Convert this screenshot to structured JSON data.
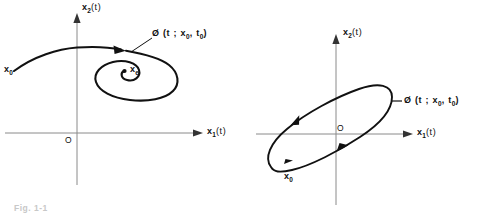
{
  "figure": {
    "caption": "Fig. 1-1",
    "ink_color": "#111111",
    "axis_color": "#8a8a8a"
  },
  "panels": [
    {
      "id": "left",
      "kind": "spiral-trajectory",
      "axis_x_label_main": "x",
      "axis_x_label_sub": "1",
      "axis_x_label_tail": "(t)",
      "axis_y_label_main": "x",
      "axis_y_label_sub": "2",
      "axis_y_label_tail": "(t)",
      "origin_label": "O",
      "initial_state_main": "x",
      "initial_state_sub": "0",
      "equilibrium_main": "x",
      "equilibrium_sub": "e",
      "trajectory_label": "Ø (t ; x",
      "trajectory_label_sub1": "0",
      "trajectory_label_mid": ", t",
      "trajectory_label_sub2": "0",
      "trajectory_label_end": ")"
    },
    {
      "id": "right",
      "kind": "closed-orbit",
      "axis_x_label_main": "x",
      "axis_x_label_sub": "1",
      "axis_x_label_tail": "(t)",
      "axis_y_label_main": "x",
      "axis_y_label_sub": "2",
      "axis_y_label_tail": "(t)",
      "origin_label": "O",
      "initial_state_main": "x",
      "initial_state_sub": "0",
      "trajectory_label": "Ø (t ; x",
      "trajectory_label_sub1": "0",
      "trajectory_label_mid": ", t",
      "trajectory_label_sub2": "0",
      "trajectory_label_end": ")"
    }
  ]
}
